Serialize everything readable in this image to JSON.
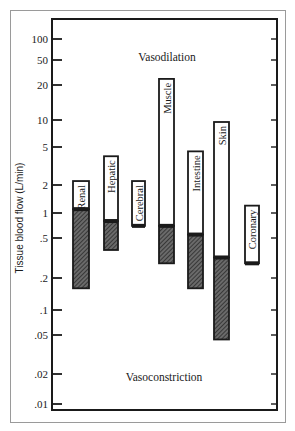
{
  "chart_data": {
    "type": "bar",
    "subtype": "floating-range-log",
    "title": "",
    "xlabel": "",
    "ylabel": "Tissue blood flow (L/min)",
    "yscale": "log",
    "ylim": [
      0.007,
      150
    ],
    "grid": false,
    "legend": null,
    "yticks": [
      100,
      50,
      20,
      10,
      5,
      2,
      1,
      0.5,
      0.2,
      0.1,
      0.05,
      0.02,
      0.01
    ],
    "ytick_labels": [
      "100",
      "50",
      "20",
      "10",
      "5",
      "2",
      "1",
      ".5",
      ".2",
      ".1",
      ".05",
      ".02",
      ".01"
    ],
    "annotations": [
      {
        "text": "Vasodilation",
        "position": "top"
      },
      {
        "text": "Vasoconstriction",
        "position": "bottom"
      }
    ],
    "categories": [
      "Renal",
      "Hepatic",
      "Cerebral",
      "Muscle",
      "Intestine",
      "Skin",
      "Coronary"
    ],
    "series": [
      {
        "name": "Vasoconstriction range (hatched)",
        "low": [
          0.16,
          0.38,
          null,
          0.28,
          0.16,
          0.045,
          null
        ],
        "high": [
          1.1,
          0.8,
          null,
          0.7,
          0.55,
          0.32,
          null
        ]
      },
      {
        "name": "Vasodilation range (open)",
        "low": [
          1.1,
          0.8,
          0.7,
          0.7,
          0.55,
          0.32,
          0.28
        ],
        "high": [
          2.2,
          4.0,
          2.2,
          25,
          4.5,
          9.5,
          1.2
        ]
      }
    ],
    "bars": [
      {
        "label": "Renal",
        "max": 2.2,
        "rest": 1.1,
        "min": 0.16
      },
      {
        "label": "Hepatic",
        "max": 4.0,
        "rest": 0.8,
        "min": 0.38
      },
      {
        "label": "Cerebral",
        "max": 2.2,
        "rest": 0.7,
        "min": 0.7
      },
      {
        "label": "Muscle",
        "max": 25,
        "rest": 0.7,
        "min": 0.28
      },
      {
        "label": "Intestine",
        "max": 4.5,
        "rest": 0.55,
        "min": 0.16
      },
      {
        "label": "Skin",
        "max": 9.5,
        "rest": 0.32,
        "min": 0.045
      },
      {
        "label": "Coronary",
        "max": 1.2,
        "rest": 0.28,
        "min": 0.28
      }
    ]
  },
  "colors": {
    "ink": "#1a1a1a",
    "hatch": "#3a3a3a",
    "border": "#9a9a9a",
    "background": "#ffffff"
  }
}
